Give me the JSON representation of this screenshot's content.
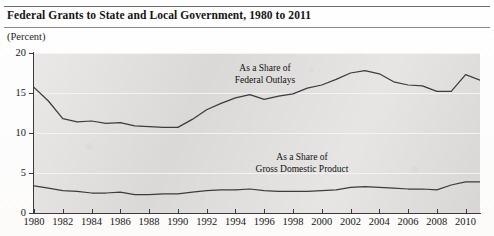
{
  "header": {
    "title": "Federal Grants to State and Local Government, 1980 to 2011",
    "units": "(Percent)"
  },
  "chart_data": {
    "type": "line",
    "title": "Federal Grants to State and Local Government, 1980 to 2011",
    "xlabel": "",
    "ylabel": "(Percent)",
    "xlim": [
      1980,
      2011
    ],
    "ylim": [
      0,
      20
    ],
    "yticks": [
      0,
      5,
      10,
      15,
      20
    ],
    "ytick_labels": [
      "0",
      "5",
      "10",
      "15",
      "20"
    ],
    "xticks": [
      1980,
      1982,
      1984,
      1986,
      1988,
      1990,
      1992,
      1994,
      1996,
      1998,
      2000,
      2002,
      2004,
      2006,
      2008,
      2010
    ],
    "xtick_labels": [
      "1980",
      "1982",
      "1984",
      "1986",
      "1988",
      "1990",
      "1992",
      "1994",
      "1996",
      "1998",
      "2000",
      "2002",
      "2004",
      "2006",
      "2008",
      "2010"
    ],
    "grid": "horizontal",
    "legend": "inline-annotations",
    "x": [
      1980,
      1981,
      1982,
      1983,
      1984,
      1985,
      1986,
      1987,
      1988,
      1989,
      1990,
      1991,
      1992,
      1993,
      1994,
      1995,
      1996,
      1997,
      1998,
      1999,
      2000,
      2001,
      2002,
      2003,
      2004,
      2005,
      2006,
      2007,
      2008,
      2009,
      2010,
      2011
    ],
    "series": [
      {
        "name": "As a Share of Federal Outlays",
        "annotation": "As a Share of\nFederal Outlays",
        "values": [
          15.7,
          14.0,
          11.8,
          11.4,
          11.5,
          11.2,
          11.3,
          10.9,
          10.8,
          10.7,
          10.7,
          11.7,
          12.9,
          13.7,
          14.4,
          14.8,
          14.2,
          14.6,
          14.9,
          15.6,
          16.0,
          16.7,
          17.5,
          17.8,
          17.4,
          16.4,
          16.0,
          15.9,
          15.2,
          15.2,
          17.3,
          16.6
        ],
        "color": "#3c3c3c"
      },
      {
        "name": "As a Share of Gross Domestic Product",
        "annotation": "As a Share of\nGross Domestic Product",
        "values": [
          3.4,
          3.1,
          2.8,
          2.7,
          2.5,
          2.5,
          2.6,
          2.3,
          2.3,
          2.4,
          2.4,
          2.6,
          2.8,
          2.9,
          2.9,
          3.0,
          2.8,
          2.7,
          2.7,
          2.7,
          2.8,
          2.9,
          3.2,
          3.3,
          3.2,
          3.1,
          3.0,
          3.0,
          2.9,
          3.5,
          3.9,
          3.9
        ],
        "color": "#3c3c3c"
      }
    ],
    "annotations": [
      {
        "text_line1": "As a Share of",
        "text_line2": "Federal Outlays"
      },
      {
        "text_line1": "As a Share of",
        "text_line2": "Gross Domestic Product"
      }
    ]
  },
  "colors": {
    "line": "#3c3c3c",
    "plot_background": "#dedddb",
    "gridline": "#f4f3f1",
    "axis": "#3a3a3a",
    "text": "#141414"
  }
}
